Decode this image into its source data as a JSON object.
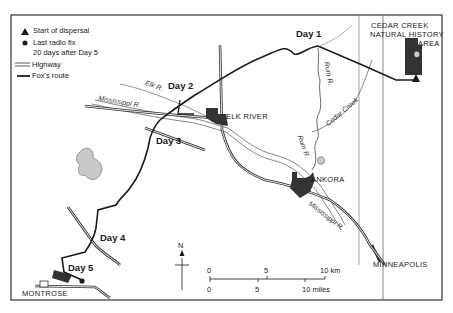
{
  "legend": {
    "items": [
      {
        "symbol": "triangle",
        "label": "Start of dispersal"
      },
      {
        "symbol": "dot",
        "label": "Last radio fix"
      },
      {
        "symbol": "none",
        "label": "20 days after Day 5"
      },
      {
        "symbol": "double-line",
        "label": "Highway"
      },
      {
        "symbol": "thick-line",
        "label": "Fox's route"
      }
    ]
  },
  "days": [
    "Day 1",
    "Day 2",
    "Day 3",
    "Day 4",
    "Day 5"
  ],
  "places": {
    "cedar_creek_line1": "CEDAR CREEK",
    "cedar_creek_line2": "NATURAL HISTORY",
    "cedar_creek_line3": "AREA",
    "elk_river": "ELK RIVER",
    "ankora": "ANKORA",
    "minneapolis": "MINNEAPOLIS",
    "montrose": "MONTROSE"
  },
  "rivers": {
    "elk": "Elk R.",
    "mississippi_upper": "Mississippi R.",
    "mississippi_lower": "Mississippi R.",
    "rum_upper": "Rum R.",
    "rum_lower": "Rum R.",
    "cedar_creek": "Cedar Creek"
  },
  "north_arrow": "N",
  "scale_bar": {
    "km_ticks": [
      "0",
      "5",
      "10 km"
    ],
    "mile_ticks": [
      "0",
      "5",
      "10 miles"
    ]
  },
  "colors": {
    "ink": "#1a1a1a",
    "urban": "#333333",
    "lake": "#c8c8c8",
    "river": "#555555"
  }
}
